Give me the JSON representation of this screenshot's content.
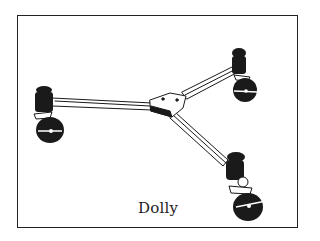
{
  "illustration": {
    "subject": "tripod-dolly",
    "caption": "Dolly",
    "colors": {
      "ink": "#1a1a1a",
      "background": "#ffffff"
    }
  }
}
